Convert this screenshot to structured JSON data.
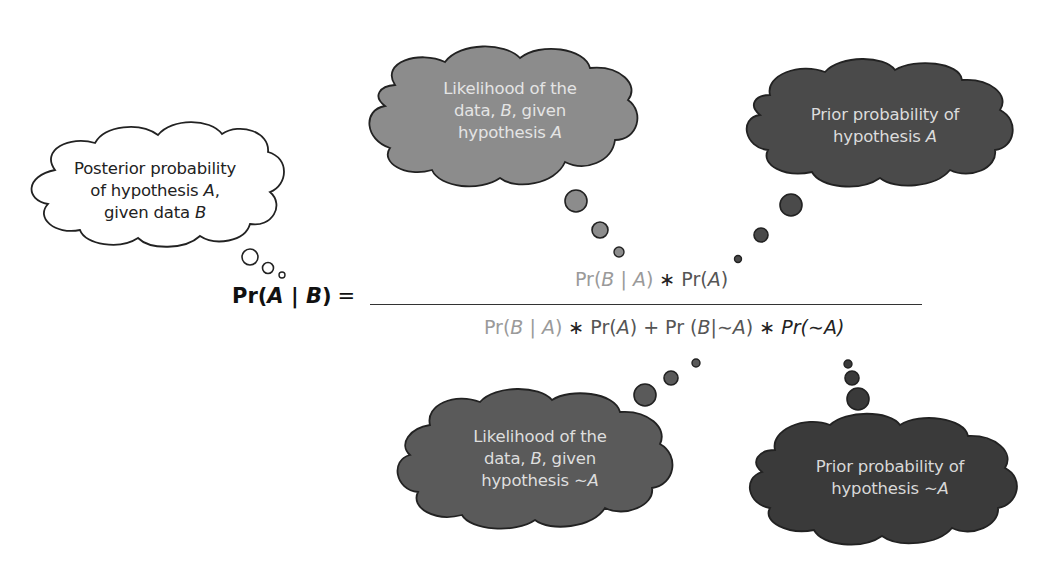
{
  "diagram": {
    "colors": {
      "posterior_cloud": "#ffffff",
      "likelihood_A_cloud": "#8c8c8c",
      "prior_A_cloud": "#4a4a4a",
      "likelihood_notA_cloud": "#5a5a5a",
      "prior_notA_cloud": "#3a3a3a",
      "cloud_outline": "#222222",
      "light_term_text": "#9a9a9a",
      "dark_term_text": "#555555"
    },
    "clouds": [
      {
        "id": "posterior",
        "lines": [
          "Posterior probability",
          "of hypothesis ",
          ", ",
          "given data "
        ],
        "line1": "Posterior probability",
        "line2_pre": "of hypothesis ",
        "line2_var": "A",
        "line2_post": ",",
        "line3_pre": "given data ",
        "line3_var": "B"
      },
      {
        "id": "likelihood-A",
        "line1": "Likelihood of the",
        "line2_pre": "data, ",
        "line2_var": "B",
        "line2_post": ", given",
        "line3_pre": "hypothesis ",
        "line3_var": "A"
      },
      {
        "id": "prior-A",
        "line1": "Prior probability of",
        "line2_pre": "hypothesis ",
        "line2_var": "A"
      },
      {
        "id": "likelihood-notA",
        "line1": "Likelihood of the",
        "line2_pre": "data, ",
        "line2_var": "B",
        "line2_post": ", given",
        "line3_pre": "hypothesis ",
        "line3_var": "∼A"
      },
      {
        "id": "prior-notA",
        "line1": "Prior probability of",
        "line2_pre": "hypothesis ",
        "line2_var": "∼A"
      }
    ],
    "equation": {
      "lhs": {
        "pr": "Pr(",
        "a": "A",
        "bar": " | ",
        "b": "B",
        "close": ")",
        "equals": "="
      },
      "numerator": {
        "likelihood": {
          "pr": "Pr(",
          "b": "B",
          "bar": " | ",
          "a": "A",
          "close": ")"
        },
        "times": " ∗ ",
        "prior": {
          "pr": "Pr(",
          "a": "A",
          "close": ")"
        }
      },
      "denominator": {
        "likelihood": {
          "pr": "Pr(",
          "b": "B",
          "bar": " | ",
          "a": "A",
          "close": ")"
        },
        "times1": " ∗ ",
        "prior": {
          "pr": "Pr(",
          "a": "A",
          "close": ")"
        },
        "plus": " + ",
        "likelihood_not": {
          "pr": "Pr (",
          "b": "B",
          "bar": "|",
          "a": "∼A",
          "close": ")"
        },
        "times2": " ∗ ",
        "prior_not": {
          "pr": "Pr(",
          "a": "∼A",
          "close": ")"
        }
      }
    }
  }
}
